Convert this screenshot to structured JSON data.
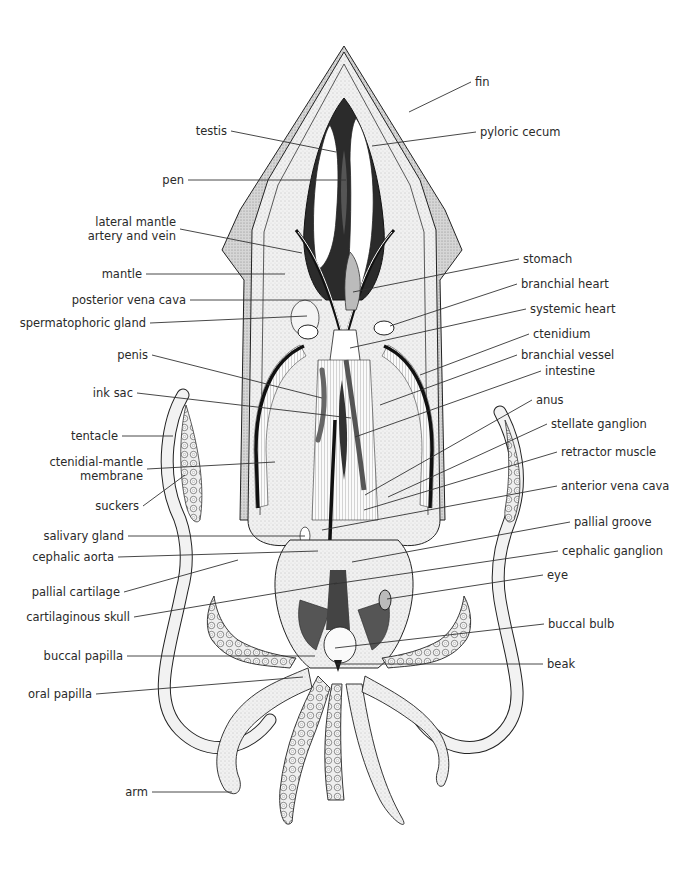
{
  "diagram": {
    "colors": {
      "line": "#222222",
      "stipple": "#d9d9d9",
      "fin": "#cfcfcf",
      "organ_dark": "#1a1a1a",
      "background": "#ffffff"
    }
  },
  "labels_left": [
    {
      "id": "testis",
      "text": "testis",
      "x": 231,
      "y": 131,
      "tx": 336,
      "ty": 152
    },
    {
      "id": "pen",
      "text": "pen",
      "x": 188,
      "y": 180,
      "tx": 346,
      "ty": 180
    },
    {
      "id": "lateral-mantle",
      "text": "lateral mantle",
      "text2": "artery and vein",
      "x": 180,
      "y": 222,
      "tx": 302,
      "ty": 253
    },
    {
      "id": "mantle",
      "text": "mantle",
      "x": 146,
      "y": 274,
      "tx": 285,
      "ty": 274
    },
    {
      "id": "posterior-vena-cava",
      "text": "posterior vena cava",
      "x": 190,
      "y": 300,
      "tx": 322,
      "ty": 300
    },
    {
      "id": "spermatophoric-gland",
      "text": "spermatophoric gland",
      "x": 150,
      "y": 323,
      "tx": 307,
      "ty": 316
    },
    {
      "id": "penis",
      "text": "penis",
      "x": 152,
      "y": 355,
      "tx": 322,
      "ty": 398
    },
    {
      "id": "ink-sac",
      "text": "ink sac",
      "x": 137,
      "y": 393,
      "tx": 351,
      "ty": 418
    },
    {
      "id": "tentacle",
      "text": "tentacle",
      "x": 122,
      "y": 436,
      "tx": 173,
      "ty": 436
    },
    {
      "id": "ctenidial-mantle-membrane",
      "text": "ctenidial-mantle",
      "text2": "membrane",
      "x": 147,
      "y": 462,
      "tx": 275,
      "ty": 462
    },
    {
      "id": "suckers",
      "text": "suckers",
      "x": 143,
      "y": 506,
      "tx": 185,
      "ty": 475
    },
    {
      "id": "salivary-gland",
      "text": "salivary gland",
      "x": 128,
      "y": 536,
      "tx": 305,
      "ty": 536
    },
    {
      "id": "cephalic-aorta",
      "text": "cephalic aorta",
      "x": 118,
      "y": 557,
      "tx": 318,
      "ty": 551
    },
    {
      "id": "pallial-cartilage",
      "text": "pallial cartilage",
      "x": 124,
      "y": 592,
      "tx": 238,
      "ty": 560
    },
    {
      "id": "cartilaginous-skull",
      "text": "cartilaginous skull",
      "x": 134,
      "y": 617,
      "tx": 337,
      "ty": 583
    },
    {
      "id": "buccal-papilla",
      "text": "buccal papilla",
      "x": 127,
      "y": 656,
      "tx": 315,
      "ty": 656
    },
    {
      "id": "oral-papilla",
      "text": "oral papilla",
      "x": 96,
      "y": 694,
      "tx": 303,
      "ty": 677
    },
    {
      "id": "arm",
      "text": "arm",
      "x": 152,
      "y": 792,
      "tx": 232,
      "ty": 792
    }
  ],
  "labels_right": [
    {
      "id": "fin",
      "text": "fin",
      "x": 471,
      "y": 82,
      "tx": 409,
      "ty": 112
    },
    {
      "id": "pyloric-cecum",
      "text": "pyloric cecum",
      "x": 476,
      "y": 132,
      "tx": 372,
      "ty": 146
    },
    {
      "id": "stomach",
      "text": "stomach",
      "x": 519,
      "y": 259,
      "tx": 353,
      "ty": 292
    },
    {
      "id": "branchial-heart",
      "text": "branchial heart",
      "x": 517,
      "y": 284,
      "tx": 390,
      "ty": 326
    },
    {
      "id": "systemic-heart",
      "text": "systemic heart",
      "x": 526,
      "y": 309,
      "tx": 350,
      "ty": 348
    },
    {
      "id": "ctenidium",
      "text": "ctenidium",
      "x": 529,
      "y": 334,
      "tx": 420,
      "ty": 375
    },
    {
      "id": "branchial-vessel",
      "text": "branchial vessel",
      "x": 517,
      "y": 355,
      "tx": 380,
      "ty": 405
    },
    {
      "id": "intestine",
      "text": "intestine",
      "x": 541,
      "y": 371,
      "tx": 355,
      "ty": 437
    },
    {
      "id": "anus",
      "text": "anus",
      "x": 532,
      "y": 400,
      "tx": 365,
      "ty": 495
    },
    {
      "id": "stellate-ganglion",
      "text": "stellate ganglion",
      "x": 547,
      "y": 424,
      "tx": 388,
      "ty": 497
    },
    {
      "id": "retractor-muscle",
      "text": "retractor muscle",
      "x": 557,
      "y": 452,
      "tx": 364,
      "ty": 510
    },
    {
      "id": "anterior-vena-cava",
      "text": "anterior vena cava",
      "x": 557,
      "y": 486,
      "tx": 322,
      "ty": 530
    },
    {
      "id": "pallial-groove",
      "text": "pallial groove",
      "x": 570,
      "y": 522,
      "tx": 352,
      "ty": 562
    },
    {
      "id": "cephalic-ganglion",
      "text": "cephalic ganglion",
      "x": 558,
      "y": 551,
      "tx": 334,
      "ty": 584
    },
    {
      "id": "eye",
      "text": "eye",
      "x": 543,
      "y": 575,
      "tx": 387,
      "ty": 599
    },
    {
      "id": "buccal-bulb",
      "text": "buccal bulb",
      "x": 544,
      "y": 624,
      "tx": 335,
      "ty": 648
    },
    {
      "id": "beak",
      "text": "beak",
      "x": 543,
      "y": 664,
      "tx": 337,
      "ty": 664
    }
  ]
}
